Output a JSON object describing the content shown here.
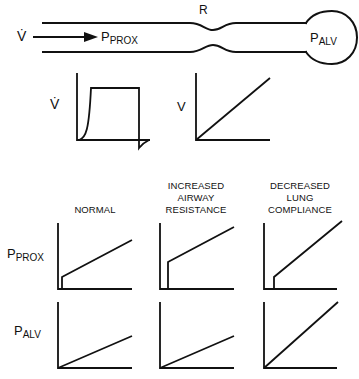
{
  "airway": {
    "flow_label": "V̇",
    "proximal_pressure": {
      "main": "P",
      "sub": "PROX"
    },
    "resistance_label": "R",
    "alveolar_pressure": {
      "main": "P",
      "sub": "ALV"
    }
  },
  "input_waveforms": {
    "flow": {
      "label": "V̇",
      "shape": "square-wave"
    },
    "volume": {
      "label": "V",
      "shape": "ramp"
    }
  },
  "columns": [
    {
      "id": "normal",
      "lines": [
        "NORMAL"
      ]
    },
    {
      "id": "increased-airway-resistance",
      "lines": [
        "INCREASED",
        "AIRWAY",
        "RESISTANCE"
      ]
    },
    {
      "id": "decreased-lung-compliance",
      "lines": [
        "DECREASED",
        "LUNG",
        "COMPLIANCE"
      ]
    }
  ],
  "rows": [
    {
      "id": "p-prox",
      "label": {
        "main": "P",
        "sub": "PROX"
      }
    },
    {
      "id": "p-alv",
      "label": {
        "main": "P",
        "sub": "ALV"
      }
    }
  ],
  "colors": {
    "stroke": "#111111",
    "background": "#ffffff"
  }
}
